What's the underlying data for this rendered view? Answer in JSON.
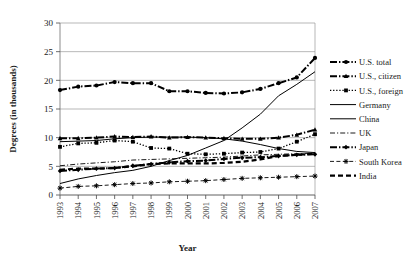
{
  "chart_data": {
    "type": "line",
    "title": "",
    "xlabel": "Year",
    "ylabel": "Degrees (in thousands)",
    "categories": [
      "1993",
      "1994",
      "1995",
      "1996",
      "1997",
      "1998",
      "1999",
      "2000",
      "2001",
      "2002",
      "2003",
      "2004",
      "2005",
      "2006",
      "2007"
    ],
    "ylim": [
      0,
      30
    ],
    "yticks": [
      0,
      5,
      10,
      15,
      20,
      25,
      30
    ],
    "grid": "horizontal",
    "legend_position": "right",
    "series": [
      {
        "name": "U.S. total",
        "marker": "circle",
        "linestyle": "thick-dash-dot",
        "values": [
          18.3,
          18.9,
          19.1,
          19.7,
          19.5,
          19.5,
          18.1,
          18.1,
          17.8,
          17.7,
          17.9,
          18.5,
          19.5,
          20.5,
          23.9
        ]
      },
      {
        "name": "U.S., citizen",
        "marker": "triangle",
        "linestyle": "thick-dash-dot",
        "values": [
          9.9,
          9.9,
          10.0,
          10.2,
          10.1,
          10.2,
          10.0,
          10.1,
          10.0,
          9.9,
          9.8,
          9.8,
          10.0,
          10.5,
          11.4
        ]
      },
      {
        "name": "U.S., foreign",
        "marker": "square",
        "linestyle": "dotted",
        "values": [
          8.4,
          9.0,
          9.1,
          9.5,
          9.3,
          8.2,
          8.1,
          7.2,
          7.1,
          7.2,
          7.4,
          7.5,
          8.1,
          9.3,
          10.6
        ]
      },
      {
        "name": "Germany",
        "marker": "none",
        "linestyle": "solid-thin",
        "values": [
          9.3,
          9.4,
          9.5,
          9.8,
          10.0,
          10.1,
          10.1,
          10.1,
          10.0,
          9.8,
          9.4,
          8.8,
          8.1,
          7.6,
          7.4
        ]
      },
      {
        "name": "China",
        "marker": "none",
        "linestyle": "solid-thin",
        "values": [
          2.0,
          2.8,
          3.4,
          3.9,
          4.3,
          5.0,
          6.0,
          6.9,
          8.2,
          9.5,
          11.7,
          14.1,
          17.3,
          19.3,
          21.5
        ]
      },
      {
        "name": "UK",
        "marker": "none",
        "linestyle": "dash-dot-thin",
        "values": [
          5.1,
          5.4,
          5.6,
          5.8,
          6.1,
          6.2,
          6.3,
          6.4,
          6.5,
          6.6,
          6.8,
          7.0,
          7.1,
          7.2,
          7.3
        ]
      },
      {
        "name": "Japan",
        "marker": "diamond",
        "linestyle": "thick-dash-dot",
        "values": [
          4.2,
          4.4,
          4.6,
          4.7,
          5.1,
          5.4,
          5.7,
          5.9,
          6.0,
          6.3,
          6.5,
          6.6,
          6.8,
          7.0,
          7.1
        ]
      },
      {
        "name": "South Korea",
        "marker": "asterisk",
        "linestyle": "dash-thin",
        "values": [
          1.2,
          1.5,
          1.6,
          1.8,
          2.0,
          2.1,
          2.3,
          2.4,
          2.5,
          2.7,
          2.9,
          3.0,
          3.1,
          3.2,
          3.3
        ]
      },
      {
        "name": "India",
        "marker": "none",
        "linestyle": "thick-dashed",
        "values": [
          4.4,
          4.6,
          4.6,
          4.7,
          5.0,
          5.4,
          5.5,
          5.5,
          5.5,
          5.6,
          5.8,
          6.2,
          6.8,
          7.0,
          7.2
        ]
      }
    ]
  },
  "legend": {
    "items": [
      {
        "label": "U.S. total"
      },
      {
        "label": "U.S., citizen"
      },
      {
        "label": "U.S., foreign"
      },
      {
        "label": "Germany"
      },
      {
        "label": "China"
      },
      {
        "label": "UK"
      },
      {
        "label": "Japan"
      },
      {
        "label": "South Korea"
      },
      {
        "label": "India"
      }
    ]
  },
  "colors": {
    "ink": "#000000",
    "grid": "#9a9a9a",
    "background": "#ffffff"
  }
}
